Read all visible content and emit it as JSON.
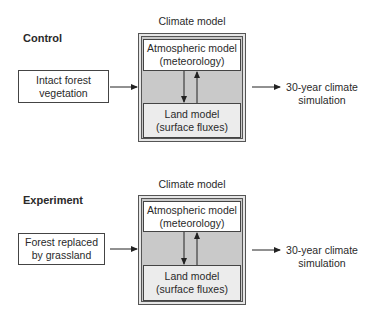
{
  "panels": [
    {
      "section_label": "Control",
      "climate_model_label": "Climate model",
      "input_lines": [
        "Intact forest",
        "vegetation"
      ],
      "atmospheric_lines": [
        "Atmospheric model",
        "(meteorology)"
      ],
      "land_lines": [
        "Land model",
        "(surface fluxes)"
      ],
      "output_lines": [
        "30-year climate",
        "simulation"
      ]
    },
    {
      "section_label": "Experiment",
      "climate_model_label": "Climate model",
      "input_lines": [
        "Forest replaced",
        "by grassland"
      ],
      "atmospheric_lines": [
        "Atmospheric model",
        "(meteorology)"
      ],
      "land_lines": [
        "Land model",
        "(surface fluxes)"
      ],
      "output_lines": [
        "30-year climate",
        "simulation"
      ]
    }
  ],
  "colors": {
    "outer_fill": "#c9c9c9",
    "land_fill": "#ececec",
    "atmo_fill": "#ffffff",
    "stroke": "#444444"
  }
}
